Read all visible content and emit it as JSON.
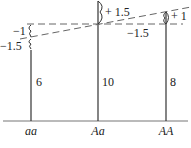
{
  "diagram": {
    "genotypes": [
      {
        "label": "aa",
        "value_label": "6",
        "deviation_label": "−1.5",
        "ref_label": "−1"
      },
      {
        "label": "Aa",
        "value_label": "10",
        "deviation_label": "+ 1.5",
        "ref_label": "−1.5"
      },
      {
        "label": "AA",
        "value_label": "8",
        "deviation_label": "+ 1"
      }
    ],
    "colors": {
      "line": "#333333",
      "dashed": "#666666"
    }
  }
}
